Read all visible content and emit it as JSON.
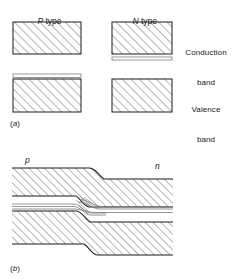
{
  "figure": {
    "title_absent": "",
    "panels": [
      {
        "tag": "(a)",
        "tag_italic_letter": "a",
        "description": "Energy band diagram of separated P type and N type semiconductor material",
        "column_headers": [
          {
            "italic": "P",
            "rest": " type"
          },
          {
            "italic": "N",
            "rest": " type"
          }
        ],
        "band_labels": [
          {
            "line1": "Conduction",
            "line2": "band"
          },
          {
            "line1": "Valence",
            "line2": "band"
          }
        ],
        "boxes": [
          {
            "name": "p-conduction-band",
            "column": "P type",
            "band": "conduction",
            "hatched": true
          },
          {
            "name": "n-conduction-band",
            "column": "N type",
            "band": "conduction",
            "hatched": true
          },
          {
            "name": "p-valence-band",
            "column": "P type",
            "band": "valence",
            "hatched": true
          },
          {
            "name": "n-valence-band",
            "column": "N type",
            "band": "valence",
            "hatched": true
          }
        ],
        "impurity_levels": [
          {
            "name": "donor-level",
            "column": "N type",
            "position": "below conduction band"
          },
          {
            "name": "acceptor-level",
            "column": "P type",
            "position": "above valence band"
          }
        ]
      },
      {
        "tag": "(b)",
        "tag_italic_letter": "b",
        "description": "Energy band diagram across a p-n junction showing band bending",
        "region_labels": [
          {
            "text": "p",
            "side": "left"
          },
          {
            "text": "n",
            "side": "right"
          }
        ],
        "bands": [
          {
            "name": "conduction-band",
            "position": "top",
            "bends": "down from p to n"
          },
          {
            "name": "valence-band",
            "position": "bottom",
            "bends": "down from p to n"
          }
        ],
        "levels": [
          {
            "name": "acceptor-level",
            "side": "p"
          },
          {
            "name": "fermi-level",
            "side": "both"
          },
          {
            "name": "donor-level",
            "side": "n"
          }
        ]
      }
    ]
  },
  "style": {
    "line_color": "#1a1a1a",
    "hatch_color": "#666666",
    "thin_line_color": "#777777",
    "background": "#ffffff"
  }
}
